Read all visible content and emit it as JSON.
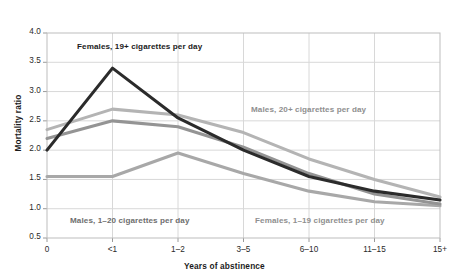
{
  "figure": {
    "clipped_top_caption": "",
    "axis_label_y": "Mortality ratio",
    "axis_label_x": "Years of abstinence"
  },
  "annotations": [
    {
      "text": "Females, 19+ cigarettes per day",
      "color": "#1b1b1b",
      "x_px": 77,
      "y_px": 42
    },
    {
      "text": "Males, 20+ cigarettes per day",
      "color": "#8f8f8f",
      "x_px": 251,
      "y_px": 105
    },
    {
      "text": "Males, 1–20 cigarettes per day",
      "color": "#6e6e6e",
      "x_px": 70,
      "y_px": 216
    },
    {
      "text": "Females, 1–19 cigarettes per day",
      "color": "#8f8f8f",
      "x_px": 255,
      "y_px": 216
    }
  ],
  "chart_data": {
    "type": "line",
    "title": "",
    "xlabel": "Years of abstinence",
    "ylabel": "Mortality ratio",
    "categories": [
      "0",
      "<1",
      "1–2",
      "3–5",
      "6–10",
      "11–15",
      "15+"
    ],
    "ylim": [
      0.5,
      4.0
    ],
    "yticks": [
      "0.5",
      "1.0",
      "1.5",
      "2.0",
      "2.5",
      "3.0",
      "3.5",
      "4.0"
    ],
    "ytick_values": [
      0.5,
      1.0,
      1.5,
      2.0,
      2.5,
      3.0,
      3.5,
      4.0
    ],
    "grid": true,
    "legend_position": "inline-annotations",
    "series": [
      {
        "name": "Females, 19+ cigarettes per day",
        "color": "#2b2b2b",
        "values": [
          2.0,
          3.4,
          2.55,
          2.0,
          1.55,
          1.3,
          1.15
        ]
      },
      {
        "name": "Males, 20+ cigarettes per day",
        "color": "#b4b4b4",
        "values": [
          2.35,
          2.7,
          2.6,
          2.3,
          1.85,
          1.5,
          1.2
        ]
      },
      {
        "name": "Females, 1–19 cigarettes per day",
        "color": "#949494",
        "values": [
          2.2,
          2.5,
          2.4,
          2.05,
          1.6,
          1.25,
          1.08
        ]
      },
      {
        "name": "Males, 1–20 cigarettes per day",
        "color": "#a8a8a8",
        "values": [
          1.55,
          1.55,
          1.95,
          1.6,
          1.3,
          1.12,
          1.05
        ]
      }
    ]
  },
  "geometry": {
    "plot_left": 47,
    "plot_right": 440,
    "plot_top": 33,
    "plot_bottom": 238
  },
  "colors": {
    "frame": "#bdbdbd",
    "grid": "#d8d8d8",
    "text": "#1b1b1b"
  }
}
